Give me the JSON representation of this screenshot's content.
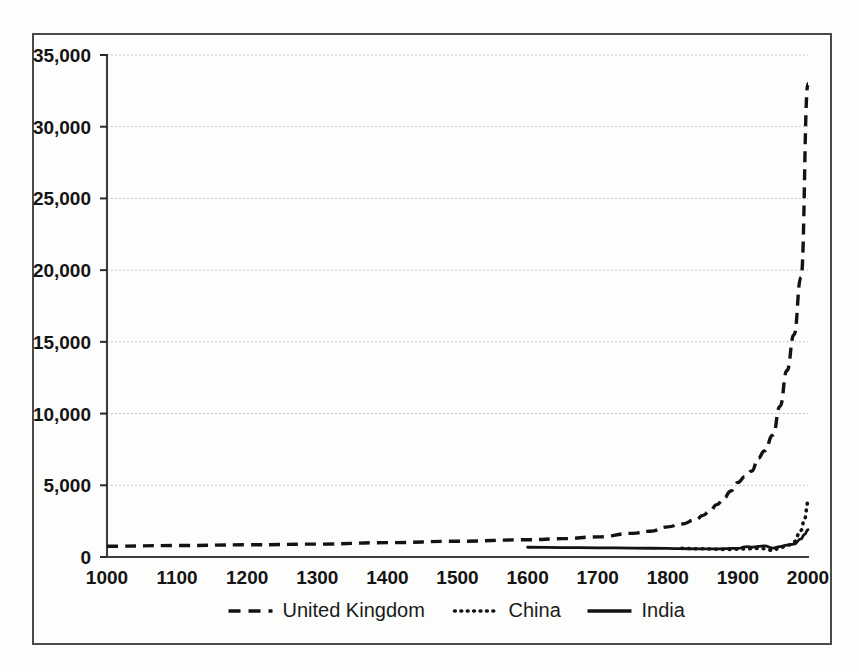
{
  "chart_data": {
    "type": "line",
    "title": "",
    "subtitle": "",
    "xlabel": "",
    "ylabel": "",
    "xlim": [
      1000,
      2000
    ],
    "ylim": [
      0,
      35000
    ],
    "grid": true,
    "grid_axis": "y",
    "legend_position": "bottom",
    "xticks": [
      "1000",
      "1100",
      "1200",
      "1300",
      "1400",
      "1500",
      "1600",
      "1700",
      "1800",
      "1900",
      "2000"
    ],
    "xtick_values": [
      1000,
      1100,
      1200,
      1300,
      1400,
      1500,
      1600,
      1700,
      1800,
      1900,
      2000
    ],
    "yticks": [
      "0",
      "5,000",
      "10,000",
      "15,000",
      "20,000",
      "25,000",
      "30,000",
      "35,000"
    ],
    "ytick_values": [
      0,
      5000,
      10000,
      15000,
      20000,
      25000,
      30000,
      35000
    ],
    "series": [
      {
        "name": "United Kingdom",
        "style": "dashed",
        "legend_marker": "dashed-line",
        "x": [
          1000,
          1100,
          1200,
          1300,
          1400,
          1500,
          1600,
          1650,
          1700,
          1750,
          1775,
          1800,
          1820,
          1840,
          1850,
          1860,
          1870,
          1880,
          1890,
          1900,
          1910,
          1913,
          1920,
          1929,
          1938,
          1950,
          1960,
          1970,
          1980,
          1990,
          2000
        ],
        "values": [
          750,
          800,
          850,
          900,
          1000,
          1100,
          1200,
          1280,
          1400,
          1650,
          1800,
          2100,
          2300,
          2600,
          2900,
          3200,
          3650,
          4100,
          4600,
          5200,
          5600,
          5800,
          6000,
          6900,
          7400,
          8500,
          10500,
          13000,
          15500,
          19500,
          33000
        ]
      },
      {
        "name": "China",
        "style": "dotted",
        "legend_marker": "dotted-line",
        "x": [
          1820,
          1840,
          1850,
          1860,
          1870,
          1880,
          1890,
          1900,
          1910,
          1913,
          1920,
          1929,
          1938,
          1950,
          1960,
          1970,
          1973,
          1980,
          1990,
          1995,
          2000
        ],
        "values": [
          600,
          580,
          570,
          560,
          540,
          530,
          530,
          540,
          560,
          580,
          570,
          600,
          580,
          450,
          660,
          780,
          840,
          1060,
          1860,
          2650,
          3800
        ]
      },
      {
        "name": "India",
        "style": "solid",
        "legend_marker": "solid-line",
        "x": [
          1600,
          1650,
          1700,
          1750,
          1800,
          1820,
          1840,
          1850,
          1860,
          1870,
          1880,
          1890,
          1900,
          1910,
          1913,
          1920,
          1929,
          1938,
          1950,
          1960,
          1970,
          1973,
          1980,
          1990,
          1995,
          2000
        ],
        "values": [
          680,
          660,
          640,
          620,
          600,
          580,
          570,
          560,
          560,
          560,
          580,
          600,
          600,
          700,
          720,
          680,
          740,
          780,
          620,
          720,
          830,
          850,
          900,
          1270,
          1570,
          1900
        ]
      }
    ]
  },
  "legend": {
    "items": [
      {
        "label": "United Kingdom",
        "marker": "dashed-line"
      },
      {
        "label": "China",
        "marker": "dotted-line"
      },
      {
        "label": "India",
        "marker": "solid-line"
      }
    ]
  },
  "colors": {
    "line": "#131313",
    "grid": "#b9b9bd",
    "axis": "#3d3d3d",
    "frame": "#4a4a4a",
    "background": "#fdfdfb",
    "text": "#141414"
  }
}
